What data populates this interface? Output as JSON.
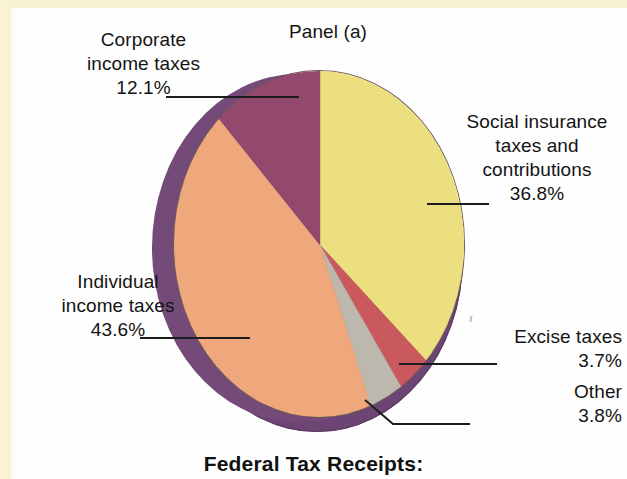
{
  "panel": {
    "title": "Panel (a)"
  },
  "caption": "Federal Tax Receipts:",
  "colors": {
    "social_insurance": "#ecdf80",
    "individual_income": "#efa87b",
    "corporate_income": "#93486e",
    "excise": "#c9595c",
    "other": "#bdb8ae",
    "pie_side_rim": "#744a79",
    "pie_shadow": "#6d4574",
    "outline": "#6f5a55",
    "leader_line": "#1d1d1d",
    "text": "#141414",
    "page_bleed": "#f8f3d2",
    "paper": "#fefefe"
  },
  "labels": {
    "corporate": {
      "line1": "Corporate",
      "line2": "income taxes",
      "pct": "12.1%"
    },
    "individual": {
      "line1": "Individual",
      "line2": "income taxes",
      "pct": "43.6%"
    },
    "social": {
      "line1": "Social insurance",
      "line2": "taxes and",
      "line3": "contributions",
      "pct": "36.8%"
    },
    "excise": {
      "line1": "Excise taxes",
      "pct": "3.7%"
    },
    "other": {
      "line1": "Other",
      "pct": "3.8%"
    }
  },
  "chart_data": {
    "type": "pie",
    "title": "Panel (a)",
    "subtitle": "Federal Tax Receipts:",
    "unit": "percent",
    "start_angle_deg": 0,
    "direction": "clockwise",
    "three_d": true,
    "legend": "labels with leader lines",
    "categories": [
      "Social insurance taxes and contributions",
      "Excise taxes",
      "Other",
      "Individual income taxes",
      "Corporate income taxes"
    ],
    "values": [
      36.8,
      3.7,
      3.8,
      43.6,
      12.1
    ],
    "slices": [
      {
        "label": "Social insurance taxes and contributions",
        "value": 36.8,
        "color": "#ecdf80"
      },
      {
        "label": "Excise taxes",
        "value": 3.7,
        "color": "#c9595c"
      },
      {
        "label": "Other",
        "value": 3.8,
        "color": "#bdb8ae"
      },
      {
        "label": "Individual income taxes",
        "value": 43.6,
        "color": "#efa87b"
      },
      {
        "label": "Corporate income taxes",
        "value": 12.1,
        "color": "#93486e"
      }
    ]
  }
}
